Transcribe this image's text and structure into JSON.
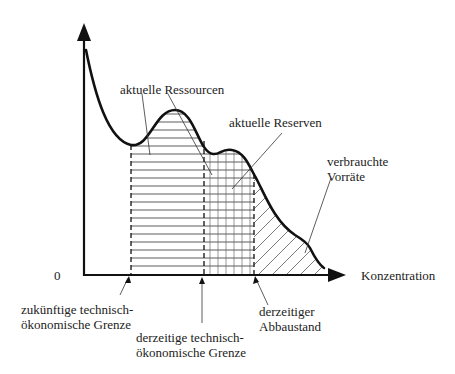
{
  "diagram": {
    "axes": {
      "origin_label": "0",
      "x_label": "Konzentration"
    },
    "labels": {
      "current_resources": "aktuelle Ressourcen",
      "current_reserves": "aktuelle Reserven",
      "consumed_stocks_line1": "verbrauchte",
      "consumed_stocks_line2": "Vorräte",
      "future_limit_line1": "zukünftige technisch-",
      "future_limit_line2": "ökonomische Grenze",
      "current_limit_line1": "derzeitige technisch-",
      "current_limit_line2": "ökonomische Grenze",
      "current_extraction_line1": "derzeitiger",
      "current_extraction_line2": "Abbaustand"
    },
    "regions": [
      {
        "name": "aktuelle Ressourcen",
        "fill": "horizontal-hatch"
      },
      {
        "name": "aktuelle Reserven",
        "fill": "grid-hatch"
      },
      {
        "name": "verbrauchte Vorräte",
        "fill": "diagonal-hatch"
      }
    ],
    "colors": {
      "line": "#111111",
      "hatch": "#333333",
      "text": "#222222",
      "background": "#ffffff"
    }
  }
}
